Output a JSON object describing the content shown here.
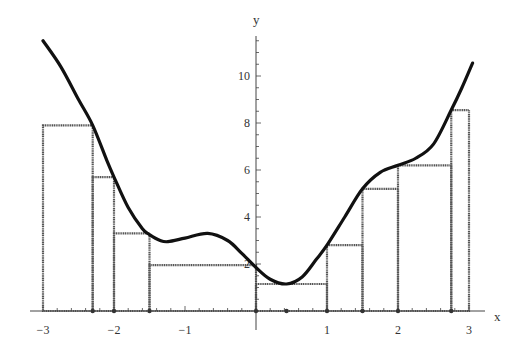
{
  "chart_data": {
    "type": "line",
    "title": "",
    "xlabel": "x",
    "ylabel": "y",
    "xlim": [
      -3,
      3
    ],
    "ylim": [
      0,
      11.5
    ],
    "grid": false,
    "x_ticks": [
      -3,
      -2,
      -1,
      1,
      2,
      3
    ],
    "x_tick_labels": [
      "−3",
      "−2",
      "−1",
      "1",
      "2",
      "3"
    ],
    "y_ticks": [
      2,
      4,
      6,
      8,
      10
    ],
    "y_tick_labels": [
      "2",
      "4",
      "6",
      "8",
      "10"
    ],
    "curve": {
      "name": "f(x)",
      "x": [
        -3.0,
        -2.75,
        -2.5,
        -2.3,
        -2.1,
        -2.0,
        -1.8,
        -1.6,
        -1.5,
        -1.35,
        -1.24,
        -1.0,
        -0.68,
        -0.4,
        -0.2,
        0.0,
        0.2,
        0.43,
        0.65,
        0.85,
        1.0,
        1.25,
        1.5,
        1.75,
        2.0,
        2.25,
        2.5,
        2.75,
        2.9,
        3.05
      ],
      "y": [
        11.5,
        10.4,
        9.0,
        7.9,
        6.4,
        5.7,
        4.4,
        3.5,
        3.25,
        3.0,
        2.95,
        3.1,
        3.3,
        3.0,
        2.45,
        1.85,
        1.35,
        1.15,
        1.45,
        2.2,
        2.8,
        4.0,
        5.2,
        5.9,
        6.2,
        6.5,
        7.1,
        8.55,
        9.5,
        10.55
      ]
    },
    "rectangles": [
      {
        "x0": -3.0,
        "x1": -2.3,
        "height": 7.9
      },
      {
        "x0": -2.3,
        "x1": -2.0,
        "height": 5.7
      },
      {
        "x0": -2.0,
        "x1": -1.5,
        "height": 3.3
      },
      {
        "x0": -1.5,
        "x1": 0.0,
        "height": 1.95
      },
      {
        "x0": 0.0,
        "x1": 1.0,
        "height": 1.15
      },
      {
        "x0": 1.0,
        "x1": 1.5,
        "height": 2.8
      },
      {
        "x0": 1.5,
        "x1": 2.0,
        "height": 5.2
      },
      {
        "x0": 2.0,
        "x1": 2.75,
        "height": 6.2
      },
      {
        "x0": 2.75,
        "x1": 3.0,
        "height": 8.55
      }
    ],
    "partition_points": [
      -3.0,
      -2.3,
      -2.0,
      -1.5,
      0.0,
      1.0,
      1.5,
      2.0,
      2.75,
      3.0
    ],
    "sample_point_markers": [
      0.43
    ],
    "annotations": []
  },
  "style": {
    "curve_color": "#111111",
    "rect_color": "#555555",
    "axis_color": "#444444",
    "background": "#ffffff"
  }
}
